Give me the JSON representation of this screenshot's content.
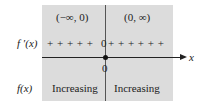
{
  "intervals": [
    "(−∞, 0)",
    "(0, ∞)"
  ],
  "rows": {
    "derivative_label": "f ′(x)",
    "function_label": "f(x)"
  },
  "sign_chart": {
    "left_signs": "+ + + + +",
    "critical_value": "0",
    "right_signs": "+ + + + + +"
  },
  "axis": {
    "variable": "x",
    "tick_label": "0"
  },
  "behavior": [
    "Increasing",
    "Increasing"
  ]
}
